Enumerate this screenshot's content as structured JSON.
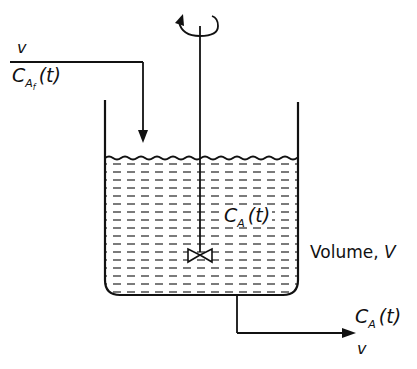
{
  "diagram": {
    "type": "CSTR (continuous stirred tank reactor) schematic",
    "colors": {
      "line": "#111111",
      "background": "#ffffff"
    },
    "feed": {
      "flow_label": "v",
      "conc_main": "C",
      "conc_sub": "A",
      "conc_subsub": "f",
      "conc_arg": "(t)"
    },
    "tank": {
      "conc_main": "C",
      "conc_sub": "A",
      "conc_arg": "(t)",
      "volume_label": "Volume, ",
      "volume_symbol": "V"
    },
    "outlet": {
      "conc_main": "C",
      "conc_sub": "A",
      "conc_arg": "(t)",
      "flow_label": "v"
    },
    "icons": [
      "rotation-arrow-icon",
      "impeller-icon",
      "flow-arrow-icon"
    ]
  }
}
